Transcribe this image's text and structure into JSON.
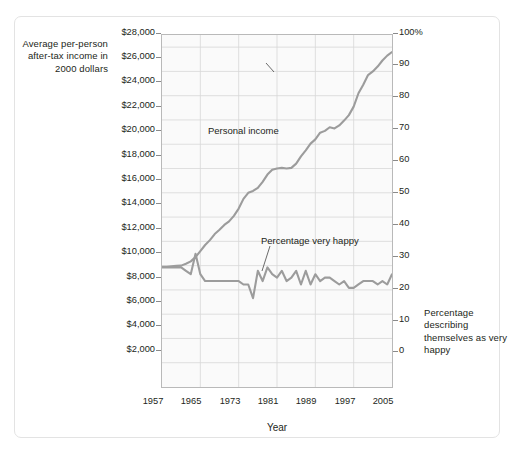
{
  "figure": {
    "background_color": "#ffffff",
    "frame_color": "#e3e3e3",
    "plot_background": "#fafafa",
    "grid_color": "#d7d7d7",
    "series_color": "#9c9c9c"
  },
  "axes": {
    "left_title": "Average per-person after-tax income in 2000 dollars",
    "right_title": "Percentage describing themselves as very happy",
    "x_title": "Year"
  },
  "chart_data": {
    "type": "line",
    "title": "",
    "subtitle": "",
    "xlabel": "Year",
    "ylabel": "Average per-person after-tax income in 2000 dollars",
    "y2label": "Percentage describing themselves as very happy",
    "grid": true,
    "legend_position": "inline-annotations",
    "xlim": [
      1957,
      2005
    ],
    "xticks": [
      1957,
      1965,
      1973,
      1981,
      1989,
      1997,
      2005
    ],
    "xticklabels": [
      "1957",
      "1965",
      "1973",
      "1981",
      "1989",
      "1997",
      "2005"
    ],
    "ylim": [
      0,
      29000
    ],
    "yticks": [
      2000,
      4000,
      6000,
      8000,
      10000,
      12000,
      14000,
      16000,
      18000,
      20000,
      22000,
      24000,
      26000,
      28000
    ],
    "yticklabels": [
      "$2,000",
      "$4,000",
      "$6,000",
      "$8,000",
      "$10,000",
      "$12,000",
      "$14,000",
      "$16,000",
      "$18,000",
      "$20,000",
      "$22,000",
      "$24,000",
      "$26,000",
      "$28,000"
    ],
    "y2lim": [
      0,
      103
    ],
    "y2ticks": [
      0,
      10,
      20,
      30,
      40,
      50,
      60,
      70,
      80,
      90,
      100
    ],
    "y2ticklabels": [
      "0",
      "10",
      "20",
      "30",
      "40",
      "50",
      "60",
      "70",
      "80",
      "90",
      "100%"
    ],
    "annotations": [
      {
        "text": "Personal income",
        "x": 1972,
        "y": 21000
      },
      {
        "text": "Percentage very happy",
        "x": 1982,
        "y": 13200
      }
    ],
    "series": [
      {
        "name": "Personal income",
        "axis": "left",
        "unit": "2000 dollars",
        "color": "#9c9c9c",
        "x": [
          1957,
          1958,
          1959,
          1960,
          1961,
          1962,
          1963,
          1964,
          1965,
          1966,
          1967,
          1968,
          1969,
          1970,
          1971,
          1972,
          1973,
          1974,
          1975,
          1976,
          1977,
          1978,
          1979,
          1980,
          1981,
          1982,
          1983,
          1984,
          1985,
          1986,
          1987,
          1988,
          1989,
          1990,
          1991,
          1992,
          1993,
          1994,
          1995,
          1996,
          1997,
          1998,
          1999,
          2000,
          2001,
          2002,
          2003,
          2004,
          2005
        ],
        "values": [
          9900,
          9900,
          9950,
          9980,
          10000,
          10150,
          10350,
          10700,
          11200,
          11700,
          12100,
          12600,
          12950,
          13350,
          13650,
          14100,
          14700,
          15500,
          16000,
          16150,
          16400,
          16900,
          17500,
          17900,
          18000,
          18050,
          18000,
          18050,
          18400,
          19000,
          19500,
          20050,
          20400,
          20950,
          21100,
          21400,
          21300,
          21550,
          21950,
          22400,
          23100,
          24200,
          24900,
          25700,
          26000,
          26400,
          26900,
          27300,
          27600
        ]
      },
      {
        "name": "Percentage very happy",
        "axis": "right",
        "unit": "percent",
        "color": "#9c9c9c",
        "x": [
          1957,
          1958,
          1959,
          1960,
          1961,
          1962,
          1963,
          1964,
          1965,
          1966,
          1967,
          1968,
          1969,
          1970,
          1971,
          1972,
          1973,
          1974,
          1975,
          1976,
          1977,
          1978,
          1979,
          1980,
          1981,
          1982,
          1983,
          1984,
          1985,
          1986,
          1987,
          1988,
          1989,
          1990,
          1991,
          1992,
          1993,
          1994,
          1995,
          1996,
          1997,
          1998,
          1999,
          2000,
          2001,
          2002,
          2003,
          2004,
          2005
        ],
        "values": [
          35,
          35,
          35,
          35,
          35,
          34,
          33,
          39,
          33,
          31,
          31,
          31,
          31,
          31,
          31,
          31,
          31,
          30,
          30,
          26,
          34,
          31,
          35,
          33,
          32,
          34,
          31,
          32,
          34,
          30,
          34,
          30,
          33,
          31,
          32,
          32,
          31,
          30,
          31,
          29,
          29,
          30,
          31,
          31,
          31,
          30,
          31,
          30,
          33
        ]
      }
    ]
  },
  "ticks": {
    "left": [
      {
        "label": "$28,000",
        "top": 33
      },
      {
        "label": "$26,000",
        "top": 57
      },
      {
        "label": "$24,000",
        "top": 81
      },
      {
        "label": "$22,000",
        "top": 106
      },
      {
        "label": "$20,000",
        "top": 130
      },
      {
        "label": "$18,000",
        "top": 155
      },
      {
        "label": "$16,000",
        "top": 179
      },
      {
        "label": "$14,000",
        "top": 203
      },
      {
        "label": "$12,000",
        "top": 228
      },
      {
        "label": "$10,000",
        "top": 252
      },
      {
        "label": "$8,000",
        "top": 277
      },
      {
        "label": "$6,000",
        "top": 301
      },
      {
        "label": "$4,000",
        "top": 325
      },
      {
        "label": "$2,000",
        "top": 350
      }
    ],
    "right": [
      {
        "label": "100%",
        "top": 33
      },
      {
        "label": "90",
        "top": 64
      },
      {
        "label": "80",
        "top": 96
      },
      {
        "label": "70",
        "top": 128
      },
      {
        "label": "60",
        "top": 160
      },
      {
        "label": "50",
        "top": 192
      },
      {
        "label": "40",
        "top": 224
      },
      {
        "label": "30",
        "top": 256
      },
      {
        "label": "20",
        "top": 288
      },
      {
        "label": "10",
        "top": 320
      },
      {
        "label": "0",
        "top": 351
      }
    ],
    "x": [
      {
        "label": "1957",
        "left": 153
      },
      {
        "label": "1965",
        "left": 191
      },
      {
        "label": "1973",
        "left": 230
      },
      {
        "label": "1981",
        "left": 268
      },
      {
        "label": "1989",
        "left": 306
      },
      {
        "label": "1997",
        "left": 345
      },
      {
        "label": "2005",
        "left": 383
      }
    ]
  }
}
